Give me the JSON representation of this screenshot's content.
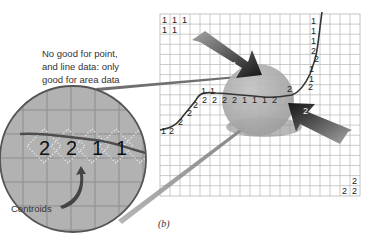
{
  "annotation": {
    "line1": "No good for point,",
    "line2": "and line data: only",
    "line3": "good for area data"
  },
  "centroids_label": "Centroids",
  "caption": "(b)",
  "arrows": [
    {
      "label": "1",
      "direction": "down-right"
    },
    {
      "label": "2",
      "direction": "up-left"
    }
  ],
  "magnifier_values": [
    "2",
    "2",
    "1",
    "1"
  ],
  "grid": {
    "columns": 20,
    "rows": 18,
    "corner_top_left": [
      [
        "1",
        "1",
        "1"
      ],
      [
        "1",
        "1"
      ]
    ],
    "corner_bottom_right": [
      [
        "2"
      ],
      [
        "2",
        "2"
      ]
    ],
    "line_a_codes": [
      "1",
      "2",
      "2",
      "2",
      "1",
      "1",
      "2",
      "2",
      "2",
      "2",
      "1",
      "1",
      "1",
      "2"
    ],
    "line_b_codes": [
      "1",
      "1",
      "1",
      "2",
      "2",
      "1",
      "1",
      "2"
    ]
  },
  "colors": {
    "grid_line": "#b5b5b5",
    "circle_fill": "#a9a9a9",
    "magnifier_fill": "#b3b3b3",
    "arrow_dark": "#1e1e1e",
    "arrow_light": "#9a9a9a"
  }
}
